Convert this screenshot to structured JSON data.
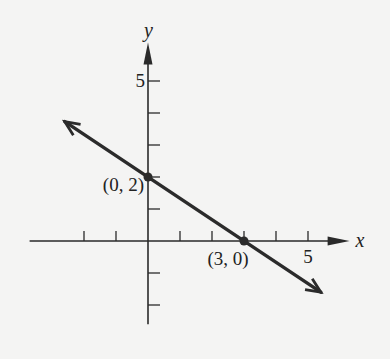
{
  "chart_data": {
    "type": "line",
    "title": "",
    "xlabel": "x",
    "ylabel": "y",
    "xlim": [
      -3.7,
      6.3
    ],
    "ylim": [
      -2.6,
      6.2
    ],
    "x_ticks": [
      -2,
      -1,
      1,
      2,
      3,
      4,
      5
    ],
    "y_ticks": [
      -2,
      -1,
      1,
      2,
      3,
      4,
      5
    ],
    "x_tick_labels": [
      {
        "value": 5,
        "label": "5"
      }
    ],
    "y_tick_labels": [
      {
        "value": 5,
        "label": "5"
      }
    ],
    "grid": false,
    "series": [
      {
        "name": "line",
        "equation": "2x + 3y = 6",
        "x": [
          -2.6,
          5.4
        ],
        "y": [
          3.73,
          -1.6
        ],
        "arrows_both_ends": true
      }
    ],
    "points": [
      {
        "x": 0,
        "y": 2,
        "label": "(0, 2)"
      },
      {
        "x": 3,
        "y": 0,
        "label": "(3, 0)"
      }
    ],
    "colors": {
      "axis": "#2a2a2a",
      "line": "#2b2b2b",
      "background": "#f4f4f3"
    }
  }
}
